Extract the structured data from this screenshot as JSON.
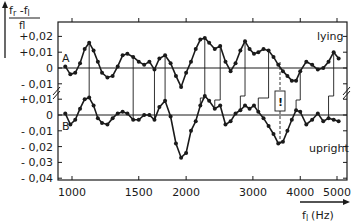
{
  "chart_data": {
    "type": "line",
    "title": "",
    "ylabel": "(f_r - f_l) / f_l",
    "xlabel": "f_l (Hz)",
    "x_scale": "log",
    "xlim": [
      930,
      5500
    ],
    "x_ticks": [
      1000,
      1500,
      2000,
      3000,
      4000,
      5000
    ],
    "x_tick_labels": [
      "1000",
      "1500",
      "2000",
      "3000",
      "4000",
      "5000"
    ],
    "y_axis_A": {
      "ticks": [
        0.02,
        0.01,
        0,
        -0.01
      ],
      "labels": [
        "+0,02",
        "+0,01",
        "0",
        "-0,01"
      ]
    },
    "y_axis_B": {
      "ticks": [
        0.01,
        0,
        -0.01,
        -0.02,
        -0.03,
        -0.04
      ],
      "labels": [
        "+0,01",
        "0",
        "-0,01",
        "-0,02",
        "-0,03",
        "-0,04"
      ]
    },
    "grid": false,
    "series": [
      {
        "name": "lying",
        "label": "A",
        "x": [
          960,
          990,
          1020,
          1050,
          1080,
          1110,
          1140,
          1170,
          1200,
          1240,
          1280,
          1320,
          1360,
          1400,
          1450,
          1500,
          1550,
          1600,
          1650,
          1700,
          1760,
          1820,
          1880,
          1940,
          2000,
          2060,
          2120,
          2180,
          2240,
          2300,
          2380,
          2460,
          2540,
          2620,
          2700,
          2780,
          2860,
          2940,
          3020,
          3100,
          3200,
          3300,
          3400,
          3500,
          3600,
          3700,
          3800,
          3900,
          4000,
          4150,
          4300,
          4450,
          4600,
          4750,
          4900,
          5050
        ],
        "values": [
          0.001,
          -0.004,
          -0.003,
          0.003,
          0.012,
          0.016,
          0.011,
          0.004,
          -0.003,
          -0.006,
          -0.005,
          0.001,
          0.008,
          0.009,
          0.007,
          0.004,
          0.002,
          0.004,
          -0.001,
          0.006,
          0.008,
          0.003,
          -0.005,
          -0.012,
          -0.003,
          0.004,
          0.012,
          0.018,
          0.019,
          0.016,
          0.012,
          0.014,
          0.004,
          -0.002,
          0.003,
          0.011,
          0.017,
          0.012,
          0.009,
          0.01,
          0.012,
          0.011,
          0.007,
          0.002,
          -0.002,
          -0.005,
          -0.008,
          -0.008,
          -0.002,
          0.004,
          0.002,
          -0.001,
          0.0,
          0.004,
          0.01,
          0.006
        ]
      },
      {
        "name": "upright",
        "label": "B",
        "x": [
          960,
          990,
          1020,
          1050,
          1080,
          1110,
          1140,
          1170,
          1200,
          1240,
          1280,
          1320,
          1360,
          1400,
          1450,
          1500,
          1550,
          1600,
          1650,
          1700,
          1760,
          1820,
          1880,
          1940,
          2000,
          2060,
          2120,
          2180,
          2240,
          2300,
          2380,
          2460,
          2540,
          2620,
          2700,
          2780,
          2860,
          2940,
          3020,
          3100,
          3200,
          3300,
          3400,
          3500,
          3600,
          3700,
          3800,
          3900,
          4000,
          4150,
          4300,
          4450,
          4600,
          4750,
          4900,
          5050
        ],
        "values": [
          0.001,
          -0.006,
          -0.003,
          0.004,
          0.01,
          0.011,
          0.006,
          -0.002,
          -0.005,
          -0.006,
          -0.002,
          0.001,
          0.002,
          0.001,
          -0.003,
          -0.003,
          0.0,
          0.0,
          -0.003,
          0.005,
          0.009,
          -0.001,
          -0.018,
          -0.027,
          -0.024,
          -0.01,
          -0.004,
          0.006,
          0.012,
          0.009,
          0.004,
          0.006,
          -0.006,
          -0.004,
          0.001,
          0.003,
          0.006,
          0.004,
          0.006,
          0.002,
          -0.002,
          -0.007,
          -0.012,
          -0.018,
          -0.017,
          -0.01,
          -0.003,
          0.003,
          0.002,
          -0.006,
          -0.003,
          0.001,
          -0.004,
          -0.002,
          -0.003,
          -0.004
        ]
      }
    ],
    "annotations": [
      "A",
      "B",
      "lying",
      "upright"
    ],
    "legend_position": "inline (right side labels)"
  },
  "labels": {
    "y_numerator": "f",
    "y_num_sub_r": "r",
    "y_minus": " -f",
    "y_num_sub_l": "l",
    "y_denominator": "fl",
    "x_axis_main": "f",
    "x_axis_sub": "l",
    "x_axis_unit": "(Hz)",
    "series_A_tag": "A",
    "series_B_tag": "B",
    "lying": "lying",
    "upright": "upright",
    "bar_marker": "!"
  }
}
